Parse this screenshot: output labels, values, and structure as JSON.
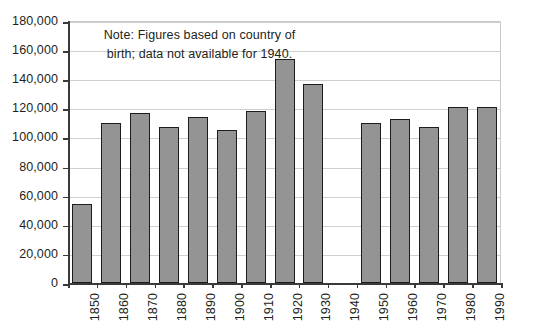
{
  "chart_data": {
    "type": "bar",
    "title": "",
    "subtitle": "",
    "xlabel": "",
    "ylabel": "",
    "ylim": [
      0,
      180000
    ],
    "ytick_step": 20000,
    "grid": true,
    "legend": null,
    "bar_color": "#949494",
    "bar_border_color": "#1d1d1d",
    "axis_color": "#3a3a3a",
    "grid_color": "#cfcfcf",
    "categories": [
      "1850",
      "1860",
      "1870",
      "1880",
      "1890",
      "1900",
      "1910",
      "1920",
      "1930",
      "1940",
      "1950",
      "1960",
      "1970",
      "1980",
      "1990"
    ],
    "values": [
      54000,
      110000,
      117000,
      107000,
      114000,
      105000,
      118000,
      154000,
      137000,
      null,
      110000,
      113000,
      107000,
      121000,
      121000
    ],
    "ytick_labels": [
      "180,000",
      "160,000",
      "140,000",
      "120,000",
      "100,000",
      "80,000",
      "60,000",
      "40,000",
      "20,000",
      "0"
    ],
    "ytick_values": [
      180000,
      160000,
      140000,
      120000,
      100000,
      80000,
      60000,
      40000,
      20000,
      0
    ],
    "annotations": [
      {
        "name": "note",
        "text": "Note: Figures based on country of birth; data not available for 1940."
      }
    ],
    "missing_data_note": "1940 has no bar — data not available"
  }
}
